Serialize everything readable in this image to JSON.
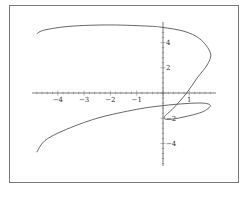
{
  "chart_data": {
    "type": "line",
    "title": "",
    "xlabel": "",
    "ylabel": "",
    "xlim": [
      -4.8,
      1.9
    ],
    "ylim": [
      -5.6,
      5.6
    ],
    "grid": false,
    "legend": null,
    "x_ticks": [
      "-4",
      "-3",
      "-2",
      "-1",
      "1"
    ],
    "y_ticks": [
      "4",
      "2",
      "-2",
      "-4"
    ],
    "series": [
      {
        "name": "parametric curve",
        "color": "#555555",
        "points": [
          [
            -4.8,
            4.7
          ],
          [
            -4.5,
            5.0
          ],
          [
            -3.5,
            5.3
          ],
          [
            -2.0,
            5.4
          ],
          [
            -0.5,
            5.3
          ],
          [
            0.0,
            5.2
          ],
          [
            0.8,
            4.9
          ],
          [
            1.4,
            4.3
          ],
          [
            1.8,
            3.2
          ],
          [
            1.7,
            2.3
          ],
          [
            1.3,
            1.2
          ],
          [
            0.9,
            0.0
          ],
          [
            0.4,
            -1.2
          ],
          [
            0.05,
            -1.9
          ],
          [
            0.2,
            -2.1
          ],
          [
            0.8,
            -1.9
          ],
          [
            1.5,
            -1.5
          ],
          [
            1.8,
            -1.0
          ],
          [
            1.5,
            -0.8
          ],
          [
            0.8,
            -0.85
          ],
          [
            0.0,
            -1.0
          ],
          [
            -1.0,
            -1.3
          ],
          [
            -2.5,
            -2.0
          ],
          [
            -3.8,
            -3.0
          ],
          [
            -4.5,
            -3.8
          ],
          [
            -4.8,
            -4.7
          ]
        ]
      }
    ]
  }
}
